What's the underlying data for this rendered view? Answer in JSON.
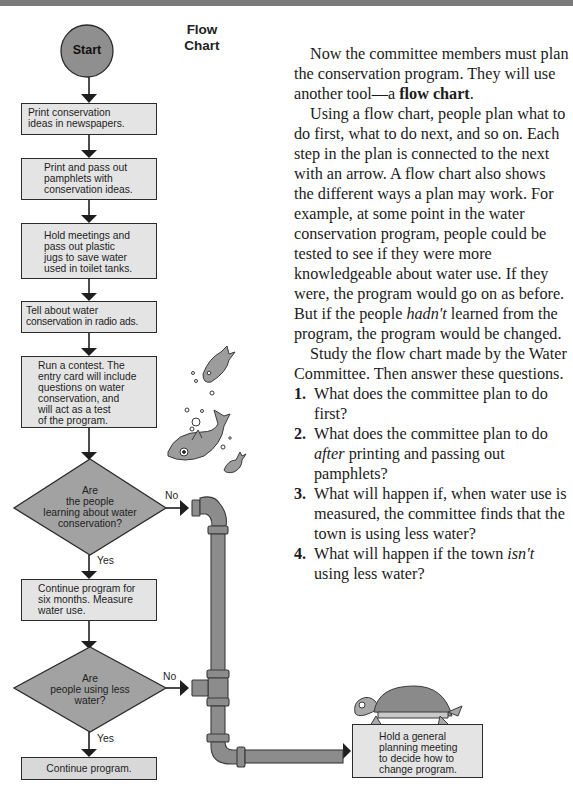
{
  "flowchart": {
    "title_line1": "Flow",
    "title_line2": "Chart",
    "start": "Start",
    "steps": [
      {
        "id": "step1",
        "lines": [
          "Print conservation",
          "ideas in newspapers."
        ]
      },
      {
        "id": "step2",
        "lines": [
          "Print and pass out",
          "pamphlets with",
          "conservation ideas."
        ]
      },
      {
        "id": "step3",
        "lines": [
          "Hold meetings and",
          "pass out plastic",
          "jugs to save water",
          "used in toilet tanks."
        ]
      },
      {
        "id": "step4",
        "lines": [
          "Tell about water",
          "conservation in radio ads."
        ]
      },
      {
        "id": "step5",
        "lines": [
          "Run a contest. The",
          "entry card will include",
          "questions on water",
          "conservation, and",
          "will act as a test",
          "of the program."
        ]
      },
      {
        "id": "step6",
        "lines": [
          "Continue program for",
          "six months. Measure",
          "water use."
        ]
      },
      {
        "id": "step7",
        "lines": [
          "Continue program."
        ]
      }
    ],
    "decisions": [
      {
        "id": "decision1",
        "lines": [
          "Are",
          "the people",
          "learning about water",
          "conservation?"
        ],
        "no": "No",
        "yes": "Yes"
      },
      {
        "id": "decision2",
        "lines": [
          "Are",
          "people using less",
          "water?"
        ],
        "no": "No",
        "yes": "Yes"
      }
    ],
    "alternate": {
      "lines": [
        "Hold a general",
        "planning meeting",
        "to decide how to",
        "change program."
      ]
    }
  },
  "text": {
    "para1_pre": "Now the committee members must plan the conservation program. They will use another tool—a ",
    "para1_bold": "flow chart",
    "para1_post": ".",
    "para2_pre": "Using a flow chart, people plan what to do first, what to do next, and so on. Each step in the plan is connected to the next with an arrow. A flow chart also shows the different ways a plan may work. For example, at some point in the water conservation program, people could be tested to see if they were more knowledgeable about water use. If they were, the program would go on as before. But if the people ",
    "para2_italic": "hadn't",
    "para2_post": " learned from the program, the program would be changed.",
    "para3": "Study the flow chart made by the Water Committee. Then answer these questions.",
    "questions": [
      {
        "num": "1.",
        "pre": "What does the committee plan to do first?",
        "italic": "",
        "post": ""
      },
      {
        "num": "2.",
        "pre": "What does the committee plan to do ",
        "italic": "after",
        "post": " printing and passing out pamphlets?"
      },
      {
        "num": "3.",
        "pre": "What will happen if, when water use is measured, the committee finds that the town is using less water?",
        "italic": "",
        "post": ""
      },
      {
        "num": "4.",
        "pre": "What will happen if the town ",
        "italic": "isn't",
        "post": " using less water?"
      }
    ]
  },
  "colors": {
    "box_fill": "#e4e4e4",
    "shape_fill": "#9a9a9a",
    "pipe": "#8c8c8c",
    "line": "#1e1e1e"
  }
}
